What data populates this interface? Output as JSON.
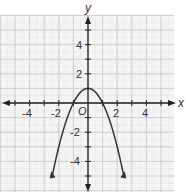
{
  "chart_data": {
    "type": "line",
    "title": "",
    "xlabel": "x",
    "ylabel": "y",
    "function": "y = -x^2 + 1",
    "xlim": [
      -6,
      6
    ],
    "ylim": [
      -6,
      6
    ],
    "grid": true,
    "x_ticks": [
      "-4",
      "-2",
      "2",
      "4"
    ],
    "y_ticks": [
      "4",
      "2",
      "-2",
      "-4"
    ],
    "origin_label": "O",
    "series": [
      {
        "name": "parabola",
        "x": [
          -2.5,
          -2,
          -1.5,
          -1,
          -0.5,
          0,
          0.5,
          1,
          1.5,
          2,
          2.5
        ],
        "y": [
          -5.25,
          -3,
          -1.25,
          0,
          0.75,
          1,
          0.75,
          0,
          -1.25,
          -3,
          -5.25
        ]
      }
    ],
    "annotations": {
      "vertex": [
        0,
        1
      ],
      "x_intercepts": [
        -1,
        1
      ]
    }
  }
}
